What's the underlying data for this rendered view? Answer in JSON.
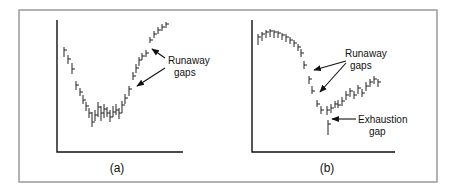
{
  "figure": {
    "panels": [
      {
        "caption": "(a)",
        "annotations": [
          {
            "text_lines": [
              "Runaway",
              "gaps"
            ]
          }
        ]
      },
      {
        "caption": "(b)",
        "annotations": [
          {
            "text_lines": [
              "Runaway",
              "gaps"
            ]
          },
          {
            "text_lines": [
              "Exhaustion",
              "gap"
            ]
          }
        ]
      }
    ]
  },
  "chart_data": [
    {
      "type": "bar",
      "subtype": "ohlc-price-bars",
      "title": "(a)",
      "xlabel": "",
      "ylabel": "",
      "grid": false,
      "legend": null,
      "description": "Downtrend into rounded bottom, then uptrend with runaway gaps",
      "bars": [
        {
          "x": 64,
          "high": 47,
          "low": 57,
          "close": 50
        },
        {
          "x": 68,
          "high": 55,
          "low": 64,
          "close": 59
        },
        {
          "x": 72,
          "high": 63,
          "low": 74,
          "close": 69
        },
        {
          "x": 76,
          "high": 81,
          "low": 90,
          "close": 85
        },
        {
          "x": 80,
          "high": 88,
          "low": 96,
          "close": 92
        },
        {
          "x": 83,
          "high": 95,
          "low": 104,
          "close": 100
        },
        {
          "x": 86,
          "high": 102,
          "low": 111,
          "close": 106
        },
        {
          "x": 89,
          "high": 108,
          "low": 118,
          "close": 113
        },
        {
          "x": 92,
          "high": 112,
          "low": 127,
          "close": 122
        },
        {
          "x": 95,
          "high": 110,
          "low": 121,
          "close": 115
        },
        {
          "x": 98,
          "high": 102,
          "low": 117,
          "close": 107
        },
        {
          "x": 101,
          "high": 106,
          "low": 121,
          "close": 113
        },
        {
          "x": 104,
          "high": 104,
          "low": 118,
          "close": 109
        },
        {
          "x": 107,
          "high": 107,
          "low": 117,
          "close": 113
        },
        {
          "x": 110,
          "high": 110,
          "low": 122,
          "close": 117
        },
        {
          "x": 113,
          "high": 106,
          "low": 117,
          "close": 112
        },
        {
          "x": 116,
          "high": 104,
          "low": 115,
          "close": 110
        },
        {
          "x": 119,
          "high": 108,
          "low": 119,
          "close": 113
        },
        {
          "x": 122,
          "high": 101,
          "low": 113,
          "close": 105
        },
        {
          "x": 125,
          "high": 94,
          "low": 104,
          "close": 98
        },
        {
          "x": 129,
          "high": 86,
          "low": 96,
          "close": 89
        },
        {
          "x": 133,
          "high": 72,
          "low": 80,
          "close": 76
        },
        {
          "x": 136,
          "high": 64,
          "low": 73,
          "close": 68
        },
        {
          "x": 139,
          "high": 57,
          "low": 66,
          "close": 60
        },
        {
          "x": 142,
          "high": 53,
          "low": 60,
          "close": 56
        },
        {
          "x": 146,
          "high": 50,
          "low": 57,
          "close": 53
        },
        {
          "x": 150,
          "high": 37,
          "low": 43,
          "close": 40
        },
        {
          "x": 154,
          "high": 31,
          "low": 38,
          "close": 34
        },
        {
          "x": 158,
          "high": 27,
          "low": 34,
          "close": 30
        },
        {
          "x": 162,
          "high": 24,
          "low": 31,
          "close": 27
        },
        {
          "x": 166,
          "high": 22,
          "low": 28,
          "close": 24
        }
      ],
      "annotations": [
        {
          "text": "Runaway gaps",
          "arrows_to_bar_x": [
            150,
            133
          ]
        }
      ]
    },
    {
      "type": "bar",
      "subtype": "ohlc-price-bars",
      "title": "(b)",
      "xlabel": "",
      "ylabel": "",
      "grid": false,
      "legend": null,
      "description": "Rounded top, decline with runaway gaps, exhaustion gap at bottom, then recovery",
      "bars": [
        {
          "x": 258,
          "high": 34,
          "low": 45,
          "close": 37
        },
        {
          "x": 262,
          "high": 32,
          "low": 41,
          "close": 34
        },
        {
          "x": 266,
          "high": 30,
          "low": 38,
          "close": 32
        },
        {
          "x": 270,
          "high": 29,
          "low": 37,
          "close": 31
        },
        {
          "x": 274,
          "high": 30,
          "low": 38,
          "close": 32
        },
        {
          "x": 278,
          "high": 31,
          "low": 38,
          "close": 33
        },
        {
          "x": 282,
          "high": 33,
          "low": 40,
          "close": 35
        },
        {
          "x": 286,
          "high": 34,
          "low": 42,
          "close": 37
        },
        {
          "x": 290,
          "high": 37,
          "low": 44,
          "close": 40
        },
        {
          "x": 294,
          "high": 40,
          "low": 47,
          "close": 43
        },
        {
          "x": 298,
          "high": 44,
          "low": 51,
          "close": 47
        },
        {
          "x": 301,
          "high": 49,
          "low": 57,
          "close": 53
        },
        {
          "x": 304,
          "high": 61,
          "low": 69,
          "close": 65
        },
        {
          "x": 309,
          "high": 76,
          "low": 84,
          "close": 79
        },
        {
          "x": 312,
          "high": 86,
          "low": 94,
          "close": 91
        },
        {
          "x": 317,
          "high": 100,
          "low": 107,
          "close": 104
        },
        {
          "x": 321,
          "high": 106,
          "low": 114,
          "close": 110
        },
        {
          "x": 327,
          "high": 106,
          "low": 115,
          "close": 110
        },
        {
          "x": 328,
          "high": 120,
          "low": 135,
          "close": 124
        },
        {
          "x": 331,
          "high": 104,
          "low": 113,
          "close": 108
        },
        {
          "x": 335,
          "high": 101,
          "low": 108,
          "close": 104
        },
        {
          "x": 338,
          "high": 100,
          "low": 108,
          "close": 105
        },
        {
          "x": 342,
          "high": 97,
          "low": 106,
          "close": 101
        },
        {
          "x": 346,
          "high": 91,
          "low": 100,
          "close": 95
        },
        {
          "x": 350,
          "high": 88,
          "low": 97,
          "close": 91
        },
        {
          "x": 354,
          "high": 91,
          "low": 99,
          "close": 95
        },
        {
          "x": 358,
          "high": 85,
          "low": 94,
          "close": 88
        },
        {
          "x": 362,
          "high": 89,
          "low": 97,
          "close": 93
        },
        {
          "x": 366,
          "high": 82,
          "low": 91,
          "close": 86
        },
        {
          "x": 370,
          "high": 79,
          "low": 87,
          "close": 82
        },
        {
          "x": 374,
          "high": 76,
          "low": 84,
          "close": 79
        },
        {
          "x": 378,
          "high": 79,
          "low": 87,
          "close": 82
        }
      ],
      "annotations": [
        {
          "text": "Runaway gaps",
          "arrows_to_bar_x": [
            312,
            317
          ]
        },
        {
          "text": "Exhaustion gap",
          "arrow_to_bar_x": 328
        }
      ]
    }
  ]
}
